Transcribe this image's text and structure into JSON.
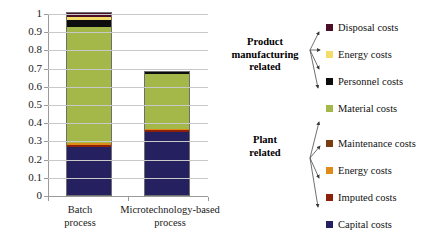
{
  "chart_data": {
    "type": "bar",
    "subtype": "stacked-bar",
    "title": "",
    "xlabel": "",
    "ylabel": "",
    "ylim": [
      0,
      1
    ],
    "grid": true,
    "legend_position": "right",
    "categories": [
      "Batch\nprocess",
      "Microtechnology-based\nprocess"
    ],
    "category_labels": [
      {
        "line1": "Batch",
        "line2": "process"
      },
      {
        "line1": "Microtechnology-based",
        "line2": "process"
      }
    ],
    "y_ticks": [
      "1",
      "0.9",
      "0.8",
      "0.7",
      "0.6",
      "0.5",
      "0.4",
      "0.3",
      "0.2",
      "0.1",
      "0"
    ],
    "y_tick_values": [
      1,
      0.9,
      0.8,
      0.7,
      0.6,
      0.5,
      0.4,
      0.3,
      0.2,
      0.1,
      0
    ],
    "series": [
      {
        "name": "Capital costs",
        "color": "#252060",
        "values": [
          0.265,
          0.345
        ]
      },
      {
        "name": "Imputed costs",
        "color": "#8c2008",
        "values": [
          0.01,
          0.013
        ]
      },
      {
        "name": "Energy costs",
        "color": "#e08a18",
        "values": [
          0.008,
          0.004
        ]
      },
      {
        "name": "Maintenance costs",
        "color": "#7a3d10",
        "values": [
          0.002,
          0.001
        ]
      },
      {
        "name": "Material costs",
        "color": "#a4b84a",
        "values": [
          0.64,
          0.302
        ]
      },
      {
        "name": "Personnel costs",
        "color": "#0d0d10",
        "values": [
          0.036,
          0.01
        ]
      },
      {
        "name": "Energy costs",
        "color": "#f2dd6a",
        "values": [
          0.015,
          0.0
        ]
      },
      {
        "name": "Disposal costs",
        "color": "#4a0f26",
        "values": [
          0.024,
          0.0
        ]
      }
    ],
    "totals": [
      1.0,
      0.675
    ],
    "annotations": []
  },
  "groups": [
    {
      "id": "product-manufacturing-related",
      "label_line1": "Product",
      "label_line2": "manufacturing",
      "label_line3": "related"
    },
    {
      "id": "plant-related",
      "label_line1": "Plant",
      "label_line2": "related"
    }
  ],
  "legend": {
    "items": [
      {
        "label": "Disposal costs",
        "color": "#4a0f26",
        "group": "product-manufacturing-related"
      },
      {
        "label": "Energy costs",
        "color": "#f2dd6a",
        "group": "product-manufacturing-related"
      },
      {
        "label": "Personnel costs",
        "color": "#0d0d10",
        "group": "product-manufacturing-related"
      },
      {
        "label": "Material costs",
        "color": "#a4b84a",
        "group": "product-manufacturing-related"
      },
      {
        "label": "Maintenance costs",
        "color": "#7a3d10",
        "group": "plant-related"
      },
      {
        "label": "Energy costs",
        "color": "#e08a18",
        "group": "plant-related"
      },
      {
        "label": "Imputed costs",
        "color": "#8c2008",
        "group": "plant-related"
      },
      {
        "label": "Capital costs",
        "color": "#252060",
        "group": "plant-related"
      }
    ]
  },
  "colors": {
    "gridline": "#c8c8c8",
    "axis": "#9a9a9a",
    "text": "#1a1a1a",
    "background": "#ffffff"
  }
}
